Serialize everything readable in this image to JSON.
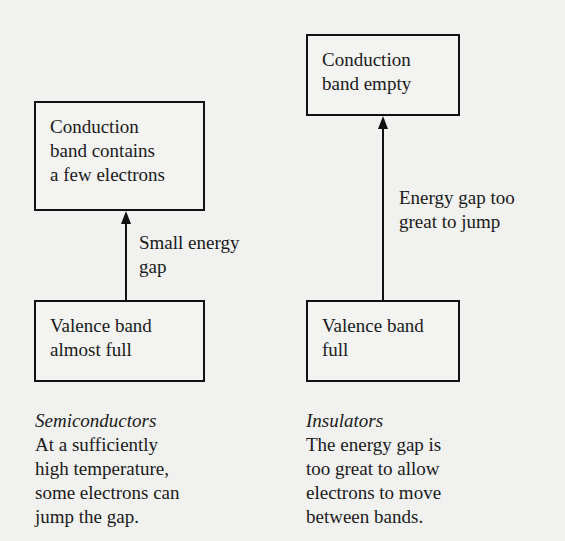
{
  "diagram": {
    "semiconductors": {
      "conduction_box": [
        "Conduction",
        "band contains",
        "a few electrons"
      ],
      "gap_label": [
        "Small energy",
        "gap"
      ],
      "valence_box": [
        "Valence band",
        "almost full"
      ],
      "caption_title": "Semiconductors",
      "caption_text": [
        "At a sufficiently",
        "high temperature,",
        "some electrons can",
        "jump the gap."
      ]
    },
    "insulators": {
      "conduction_box": [
        "Conduction",
        "band empty"
      ],
      "gap_label": [
        "Energy gap too",
        "great to jump"
      ],
      "valence_box": [
        "Valence band",
        "full"
      ],
      "caption_title": "Insulators",
      "caption_text": [
        "The energy gap is",
        "too great to allow",
        "electrons to move",
        "between bands."
      ]
    }
  }
}
